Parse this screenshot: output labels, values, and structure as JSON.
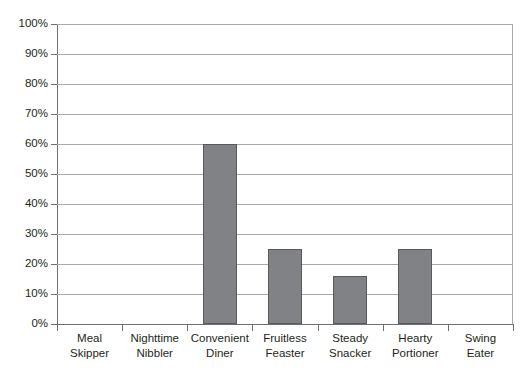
{
  "chart_data": {
    "type": "bar",
    "title": "",
    "subtitle": "",
    "xlabel": "",
    "ylabel": "",
    "categories": [
      "Meal Skipper",
      "Nighttime Nibbler",
      "Convenient Diner",
      "Fruitless Feaster",
      "Steady Snacker",
      "Hearty Portioner",
      "Swing Eater"
    ],
    "category_lines": [
      [
        "Meal",
        "Skipper"
      ],
      [
        "Nighttime",
        "Nibbler"
      ],
      [
        "Convenient",
        "Diner"
      ],
      [
        "Fruitless",
        "Feaster"
      ],
      [
        "Steady",
        "Snacker"
      ],
      [
        "Hearty",
        "Portioner"
      ],
      [
        "Swing",
        "Eater"
      ]
    ],
    "values": [
      0,
      0,
      60,
      25,
      16,
      25,
      0
    ],
    "value_labels": [
      "0%",
      "0%",
      "60%",
      "25%",
      "16%",
      "25%",
      "0%"
    ],
    "ylim": [
      0,
      100
    ],
    "ytick_values": [
      0,
      10,
      20,
      30,
      40,
      50,
      60,
      70,
      80,
      90,
      100
    ],
    "ytick_labels": [
      "0%",
      "10%",
      "20%",
      "30%",
      "40%",
      "50%",
      "60%",
      "70%",
      "80%",
      "90%",
      "100%"
    ],
    "grid": true,
    "grid_axis": "y",
    "legend": false,
    "legend_position": "none",
    "bar_color": "#808285",
    "bar_border_color": "#58595b",
    "gridline_color": "#a7a9ac",
    "axis_color": "#6d6e71",
    "text_color": "#231f20",
    "background_color": "#ffffff"
  }
}
